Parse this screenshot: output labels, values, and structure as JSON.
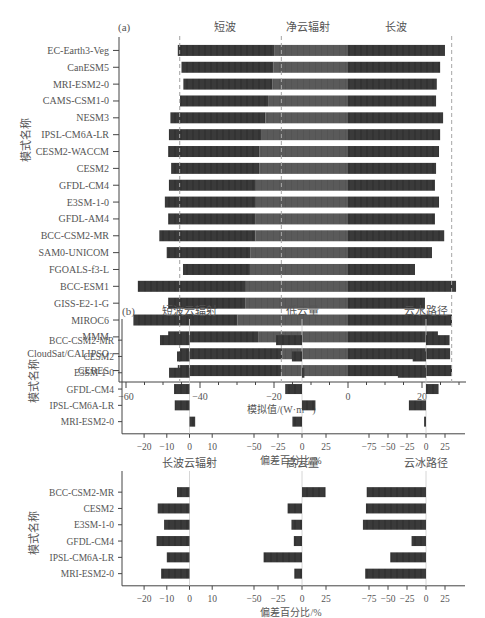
{
  "chart_data": [
    {
      "id": "a",
      "panel_label": "(a)",
      "type": "bar",
      "orientation": "horizontal",
      "stacked": true,
      "section_titles": [
        "短波",
        "净云辐射",
        "长波"
      ],
      "ylabel": "模式名称",
      "xlabel": "模拟值/(W·m⁻²)",
      "xlim": [
        -62,
        31
      ],
      "xticks": [
        -60,
        -40,
        -20,
        0,
        20
      ],
      "reference_lines": [
        -45.5,
        -18,
        28
      ],
      "categories": [
        "EC-Earth3-Veg",
        "CanESM5",
        "MRI-ESM2-0",
        "CAMS-CSM1-0",
        "NESM3",
        "IPSL-CM6A-LR",
        "CESM2-WACCM",
        "CESM2",
        "GFDL-CM4",
        "E3SM-1-0",
        "GFDL-AM4",
        "BCC-CSM2-MR",
        "SAM0-UNICOM",
        "FGOALS-f3-L",
        "BCC-ESM1",
        "GISS-E2-1-G",
        "MIROC6",
        "MMM",
        "CloudSat/CALIPSO",
        "CERES"
      ],
      "series": [
        {
          "name": "短波",
          "values": [
            -46.0,
            -45.0,
            -44.5,
            -45.4,
            -48.0,
            -48.4,
            -48.6,
            -47.8,
            -48.4,
            -49.5,
            -48.6,
            -51.0,
            -49.0,
            -44.6,
            -56.8,
            -48.6,
            -58.0,
            -48.6,
            -45.4,
            -46.0
          ]
        },
        {
          "name": "净云辐射",
          "values": [
            -19.8,
            -20.1,
            -20.5,
            -21.6,
            -22.3,
            -23.5,
            -24.0,
            -24.0,
            -24.9,
            -24.9,
            -25.1,
            -25.0,
            -26.3,
            -26.5,
            -27.6,
            -27.8,
            -29.9,
            -24.3,
            -17.8,
            -17.9
          ]
        },
        {
          "name": "长波",
          "values": [
            26.2,
            24.9,
            24.0,
            23.8,
            25.7,
            24.9,
            24.6,
            23.8,
            23.5,
            24.6,
            23.5,
            26.0,
            22.7,
            18.1,
            29.2,
            20.8,
            28.1,
            24.3,
            27.6,
            28.1
          ]
        }
      ]
    },
    {
      "id": "b-top",
      "panel_label": "(b)",
      "type": "bar",
      "orientation": "horizontal",
      "ylabel": "模式名称",
      "xlabel": "偏差百分比/%",
      "categories": [
        "BCC-CSM2-MR",
        "CESM2",
        "E3SM-1-0",
        "GFDL-CM4",
        "IPSL-CM6A-LR",
        "MRI-ESM2-0"
      ],
      "subplots": [
        {
          "title": "短波云辐射",
          "xticks": [
            -20,
            -10,
            0,
            10
          ],
          "xlim": [
            -29,
            12
          ],
          "values": [
            -13,
            -5.5,
            -9,
            -6.8,
            -6.5,
            2.5
          ]
        },
        {
          "title": "低云量",
          "xticks": [
            -50,
            -25,
            0,
            25
          ],
          "xlim": [
            -62,
            45
          ],
          "values": [
            -27,
            -10.5,
            2.5,
            -17.5,
            14,
            -10
          ]
        },
        {
          "title": "云水路径",
          "xticks": [
            -75,
            -50,
            -25,
            0,
            25
          ],
          "xlim": [
            -100,
            48
          ],
          "values": [
            31,
            -17.5,
            -37,
            16.5,
            -22.5,
            -2.5
          ]
        }
      ]
    },
    {
      "id": "b-bottom",
      "type": "bar",
      "orientation": "horizontal",
      "ylabel": "模式名称",
      "xlabel": "偏差百分比/%",
      "categories": [
        "BCC-CSM2-MR",
        "CESM2",
        "E3SM-1-0",
        "GFDL-CM4",
        "IPSL-CM6A-LR",
        "MRI-ESM2-0"
      ],
      "subplots": [
        {
          "title": "长波云辐射",
          "xticks": [
            -20,
            -10,
            0,
            10
          ],
          "xlim": [
            -29,
            12
          ],
          "values": [
            -5.5,
            -14,
            -11.2,
            -14.5,
            -10,
            -12.5
          ]
        },
        {
          "title": "高云量",
          "xticks": [
            -50,
            -25,
            0,
            25
          ],
          "xlim": [
            -62,
            45
          ],
          "values": [
            24.5,
            -15,
            -11,
            -8.5,
            -40,
            -8
          ]
        },
        {
          "title": "云冰路径",
          "xticks": [
            -75,
            -50,
            -25,
            0,
            25
          ],
          "xlim": [
            -100,
            48
          ],
          "values": [
            -78,
            -79,
            -83,
            -19,
            -47,
            -80
          ]
        }
      ]
    }
  ]
}
